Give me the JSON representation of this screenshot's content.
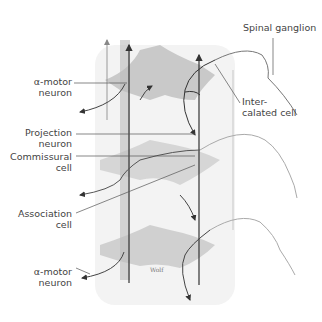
{
  "labels": {
    "spinal_ganglion": "Spinal ganglion",
    "alpha_motor_top_1": "α-motor",
    "alpha_motor_top_2": "neuron",
    "intercalated_1": "Inter-",
    "intercalated_2": "calated cell",
    "projection_1": "Projection",
    "projection_2": "neuron",
    "commissural_1": "Commissural",
    "commissural_2": "cell",
    "association_1": "Association",
    "association_2": "cell",
    "alpha_motor_bottom_1": "α-motor",
    "alpha_motor_bottom_2": "neuron",
    "signature": "Wolf"
  }
}
